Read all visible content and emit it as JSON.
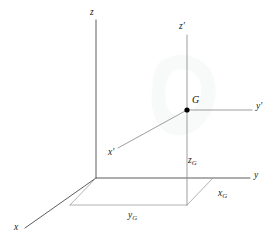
{
  "figure": {
    "background_color": "#ffffff",
    "line_color": "#4a4a4a",
    "light_line_color": "#9a9a9a",
    "text_color": "#1a1a1a",
    "point_color": "#000000",
    "width": 276,
    "height": 249
  },
  "labels": {
    "z": "z",
    "z_prime": "z′",
    "y": "y",
    "y_prime": "y′",
    "x": "x",
    "x_prime": "x′",
    "G": "G",
    "x_G_base": "x",
    "x_G_sub": "G",
    "y_G_base": "y",
    "y_G_sub": "G",
    "z_G_base": "z",
    "z_G_sub": "G"
  },
  "geometry": {
    "origin": {
      "x": 96,
      "y": 178
    },
    "z_axis_top": {
      "x": 96,
      "y": 20
    },
    "y_axis_end": {
      "x": 250,
      "y": 178
    },
    "x_axis_end": {
      "x": 25,
      "y": 228
    },
    "point_G": {
      "x": 187,
      "y": 110
    },
    "z_prime_top": {
      "x": 187,
      "y": 35
    },
    "z_prime_foot": {
      "x": 187,
      "y": 205
    },
    "y_prime_end": {
      "x": 252,
      "y": 110
    },
    "x_prime_end": {
      "x": 118,
      "y": 148
    },
    "ground_corner_right": {
      "x": 213,
      "y": 178
    },
    "ground_corner_near": {
      "x": 187,
      "y": 205
    },
    "ground_corner_left": {
      "x": 70,
      "y": 205
    }
  }
}
